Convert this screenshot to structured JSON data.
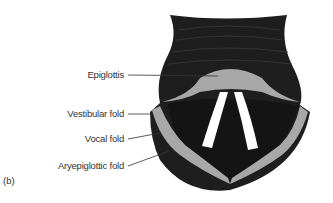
{
  "figure": {
    "panel_label": "(b)",
    "labels": [
      {
        "id": "epiglottis",
        "text": "Epiglottis"
      },
      {
        "id": "vestibular-fold",
        "text": "Vestibular fold"
      },
      {
        "id": "vocal-fold",
        "text": "Vocal fold"
      },
      {
        "id": "aryepiglottic-fold",
        "text": "Aryepiglottic fold"
      }
    ],
    "colors": {
      "tissue_dark": "#1e1e1e",
      "fold_gray": "#a8a8a8",
      "vocal_white": "#ffffff",
      "leader_line": "#333333"
    }
  }
}
